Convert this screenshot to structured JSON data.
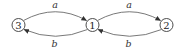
{
  "diagram": {
    "type": "state-graph",
    "nodes": [
      {
        "id": "3",
        "label": "3",
        "cx": 18.5,
        "cy": 25,
        "r": 6.5
      },
      {
        "id": "1",
        "label": "1",
        "cx": 92.5,
        "cy": 25,
        "r": 6.5
      },
      {
        "id": "2",
        "label": "2",
        "cx": 166.5,
        "cy": 25,
        "r": 6.5
      }
    ],
    "edges": [
      {
        "from": "3",
        "to": "1",
        "label": "a",
        "position": "top"
      },
      {
        "from": "1",
        "to": "3",
        "label": "b",
        "position": "bottom"
      },
      {
        "from": "1",
        "to": "2",
        "label": "a",
        "position": "top"
      },
      {
        "from": "2",
        "to": "1",
        "label": "b",
        "position": "bottom"
      }
    ],
    "colors": {
      "stroke": "#3a3a3a",
      "text": "#222222",
      "background": "#ffffff"
    }
  }
}
